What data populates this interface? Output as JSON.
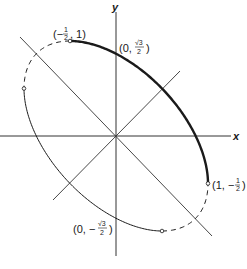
{
  "diagram": {
    "equation": "x^2 + xy + y^2 = 3/4",
    "axes": {
      "x_label": "x",
      "y_label": "y"
    },
    "origin_px": [
      116,
      136
    ],
    "scale_px": [
      92,
      95
    ],
    "ellipse": {
      "semi_major": 1.2247,
      "semi_minor": 0.7071,
      "major_dir": [
        0.7071,
        -0.7071
      ],
      "minor_dir": [
        0.7071,
        0.7071
      ],
      "arcs": [
        {
          "name": "thick-solid-arc",
          "from_deg": 30,
          "to_deg": 150,
          "style": "thick"
        },
        {
          "name": "dashed-arc-upper-left",
          "from_deg": 150,
          "to_deg": 210,
          "style": "dashed"
        },
        {
          "name": "thin-solid-arc",
          "from_deg": 210,
          "to_deg": 330,
          "style": "thin"
        },
        {
          "name": "dashed-arc-lower-right",
          "from_deg": 330,
          "to_deg": 390,
          "style": "dashed"
        }
      ]
    },
    "points": [
      {
        "name": "point-neg-half-one",
        "label": "(−½, 1)",
        "x": -0.5,
        "y": 1,
        "open": true
      },
      {
        "name": "point-zero-root3-over-2",
        "label": "(0, √3/2)",
        "x": 0,
        "y": 0.866,
        "open": false
      },
      {
        "name": "point-one-neg-half",
        "label": "(1, −½)",
        "x": 1,
        "y": -0.5,
        "open": true
      },
      {
        "name": "point-zero-neg-root3-over-2",
        "label": "(0, −√3/2)",
        "x": 0,
        "y": -0.866,
        "open": false
      },
      {
        "name": "point-neg-one-half",
        "label": "",
        "x": -1,
        "y": 0.5,
        "open": true
      },
      {
        "name": "point-half-neg-one",
        "label": "",
        "x": 0.5,
        "y": -1,
        "open": true
      }
    ],
    "labels": {
      "p1_open": "(−",
      "p1_num": "1",
      "p1_den": "2",
      "p1_close": ", 1)",
      "p2_open": "(0,",
      "p2_num": "√3",
      "p2_den": "2",
      "p2_close": ")",
      "p3_open": "(1, −",
      "p3_num": "1",
      "p3_den": "2",
      "p3_close": ")",
      "p4_open": "(0, −",
      "p4_num": "√3",
      "p4_den": "2",
      "p4_close": ")"
    }
  }
}
